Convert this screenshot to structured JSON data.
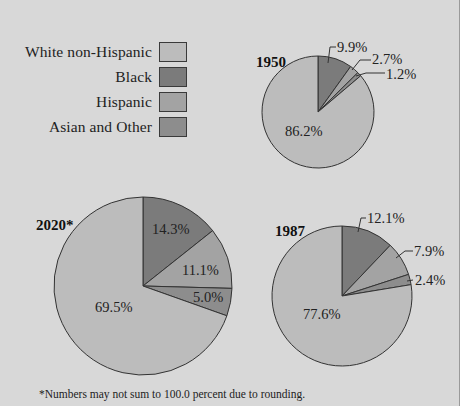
{
  "legend": {
    "items": [
      {
        "label": "White non-Hispanic",
        "color": "#bcbcbc"
      },
      {
        "label": "Black",
        "color": "#7b7b7b"
      },
      {
        "label": "Hispanic",
        "color": "#a3a3a3"
      },
      {
        "label": "Asian and Other",
        "color": "#8d8d8d"
      }
    ]
  },
  "footnote": "*Numbers may not sum to 100.0 percent due to rounding.",
  "chart_data": [
    {
      "type": "pie",
      "title": "1950",
      "categories": [
        "Black",
        "Hispanic",
        "Asian and Other",
        "White non-Hispanic"
      ],
      "values": [
        9.9,
        2.7,
        1.2,
        86.2
      ],
      "labels": [
        "9.9%",
        "2.7%",
        "1.2%",
        "86.2%"
      ]
    },
    {
      "type": "pie",
      "title": "1987",
      "categories": [
        "Black",
        "Hispanic",
        "Asian and Other",
        "White non-Hispanic"
      ],
      "values": [
        12.1,
        7.9,
        2.4,
        77.6
      ],
      "labels": [
        "12.1%",
        "7.9%",
        "2.4%",
        "77.6%"
      ]
    },
    {
      "type": "pie",
      "title": "2020*",
      "categories": [
        "Black",
        "Hispanic",
        "Asian and Other",
        "White non-Hispanic"
      ],
      "values": [
        14.3,
        11.1,
        5.0,
        69.5
      ],
      "labels": [
        "14.3%",
        "11.1%",
        "5.0%",
        "69.5%"
      ]
    }
  ]
}
